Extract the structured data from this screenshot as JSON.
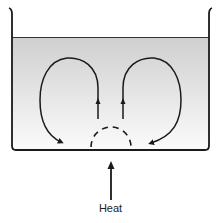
{
  "diagram": {
    "type": "convection-currents-in-beaker",
    "labels": {
      "heat": "Heat"
    },
    "elements": [
      "beaker",
      "liquid",
      "left-convection-loop",
      "right-convection-loop",
      "heated-region-dashed",
      "heat-arrow"
    ],
    "colors": {
      "stroke": "#1a1a1a",
      "liquid_top": "#cfcfcf",
      "liquid_bottom": "#fafafa"
    }
  }
}
